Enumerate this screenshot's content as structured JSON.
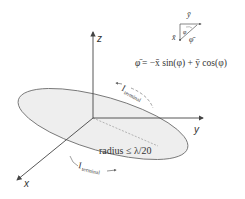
{
  "diagram": {
    "axes": {
      "z_label": "z",
      "y_label": "y",
      "x_label": "x"
    },
    "disk": {
      "radius_label": "radius ≤ λ/20",
      "fill_color": "#eeeeee",
      "stroke_color": "#777777"
    },
    "currents": {
      "upper_label_main": "I",
      "upper_label_sub": "terminal",
      "lower_label_main": "I",
      "lower_label_sub": "terminal"
    },
    "inset": {
      "y_hat": "ȳ",
      "x_hat": "x̄",
      "phi_angle": "φ",
      "phi_hat": "φ̄"
    },
    "formula": {
      "lhs": "φ̄",
      "rhs": "= −x̄ sin(φ) + ȳ cos(φ)"
    }
  }
}
